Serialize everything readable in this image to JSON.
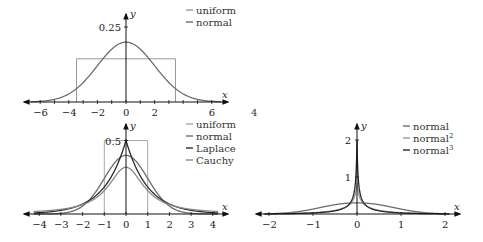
{
  "stray_label": "4",
  "chart_data": [
    {
      "id": "top",
      "type": "line",
      "title": "",
      "xlabel": "x",
      "ylabel": "y",
      "xlim": [
        -6.8,
        6.8
      ],
      "ylim": [
        0,
        0.29
      ],
      "xticks": [
        -6,
        -5,
        -4,
        -3,
        -2,
        -1,
        0,
        1,
        2,
        3,
        4,
        5,
        6
      ],
      "xtick_labels": {
        "-6": "−6",
        "-4": "−4",
        "-2": "−2",
        "0": "0",
        "2": "2",
        "6": "6"
      },
      "yticks": [
        0.25
      ],
      "ytick_labels": [
        "0.25"
      ],
      "grid": false,
      "legend_position": "upper right",
      "series": [
        {
          "name": "uniform",
          "kind": "uniform",
          "a": -3.46,
          "b": 3.46,
          "height": 0.144,
          "color": "#9a9a9a"
        },
        {
          "name": "normal",
          "kind": "normal",
          "mu": 0,
          "sigma": 2,
          "peak": 0.199,
          "color": "#6e6e6e"
        }
      ]
    },
    {
      "id": "bottom-left",
      "type": "line",
      "title": "",
      "xlabel": "x",
      "ylabel": "y",
      "xlim": [
        -4.4,
        4.4
      ],
      "ylim": [
        0,
        0.56
      ],
      "xticks": [
        -4,
        -3,
        -2,
        -1,
        0,
        1,
        2,
        3,
        4
      ],
      "xtick_labels": {
        "-4": "−4",
        "-3": "−3",
        "-2": "−2",
        "-1": "−1",
        "0": "0",
        "1": "1",
        "2": "2",
        "3": "3",
        "4": "4"
      },
      "yticks": [
        0.5
      ],
      "ytick_labels": [
        "0.5"
      ],
      "grid": false,
      "legend_position": "upper right",
      "series": [
        {
          "name": "uniform",
          "kind": "uniform",
          "a": -1,
          "b": 1,
          "height": 0.5,
          "color": "#a8a8a8"
        },
        {
          "name": "normal",
          "kind": "normal",
          "mu": 0,
          "sigma": 1,
          "peak": 0.399,
          "color": "#6e6e6e"
        },
        {
          "name": "Laplace",
          "kind": "laplace",
          "mu": 0,
          "b": 1,
          "peak": 0.5,
          "color": "#2a2a2a"
        },
        {
          "name": "Cauchy",
          "kind": "cauchy",
          "x0": 0,
          "gamma": 1,
          "peak": 0.318,
          "color": "#8a8a8a"
        }
      ]
    },
    {
      "id": "bottom-right",
      "type": "line",
      "title": "",
      "xlabel": "x",
      "ylabel": "y",
      "xlim": [
        -2.25,
        2.25
      ],
      "ylim": [
        0,
        2.25
      ],
      "xticks": [
        -2,
        -1,
        0,
        1,
        2
      ],
      "xtick_labels": {
        "-2": "−2",
        "-1": "−1",
        "0": "0",
        "1": "1",
        "2": "2"
      },
      "yticks": [
        1,
        2
      ],
      "ytick_labels": [
        "1",
        "2"
      ],
      "grid": false,
      "legend_position": "upper right",
      "series": [
        {
          "name": "normal",
          "sup": "",
          "kind": "flat",
          "peak": 0.3,
          "color": "#6e6e6e"
        },
        {
          "name": "normal",
          "sup": "2",
          "kind": "cusp",
          "peak": 1.1,
          "color": "#9a9a9a"
        },
        {
          "name": "normal",
          "sup": "3",
          "kind": "cusp3",
          "peak": 2.0,
          "color": "#2a2a2a"
        }
      ]
    }
  ]
}
